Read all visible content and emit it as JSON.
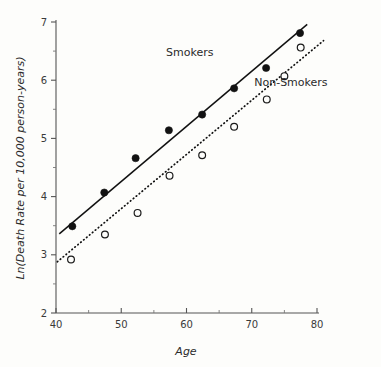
{
  "chart_data": {
    "type": "scatter",
    "title": "",
    "xlabel": "Age",
    "ylabel": "Ln(Death Rate per 10,000 person-years)",
    "xlim": [
      40,
      80
    ],
    "ylim": [
      2,
      7
    ],
    "xticks": [
      40,
      50,
      60,
      70,
      80
    ],
    "yticks": [
      2,
      3,
      4,
      5,
      6,
      7
    ],
    "x_minor_ticks": [
      45,
      55,
      65,
      75
    ],
    "y_minor_ticks": [
      2.5,
      3.5,
      4.5,
      5.5,
      6.5
    ],
    "xtick_labels": [
      "40",
      "50",
      "60",
      "70",
      "80"
    ],
    "ytick_labels": [
      "2",
      "3",
      "4",
      "5",
      "6",
      "7"
    ],
    "grid": false,
    "legend_position": "inline-annotation",
    "series": [
      {
        "name": "Smokers",
        "marker": "filled-circle",
        "fit_line_style": "solid",
        "points": [
          {
            "x": 42.5,
            "y": 3.49
          },
          {
            "x": 47.4,
            "y": 4.07
          },
          {
            "x": 52.2,
            "y": 4.66
          },
          {
            "x": 57.3,
            "y": 5.14
          },
          {
            "x": 62.4,
            "y": 5.41
          },
          {
            "x": 67.3,
            "y": 5.86
          },
          {
            "x": 72.2,
            "y": 6.21
          },
          {
            "x": 77.4,
            "y": 6.81
          }
        ],
        "fit_line": {
          "x1": 40.5,
          "y1": 3.36,
          "x2": 78.5,
          "y2": 6.96
        }
      },
      {
        "name": "Non-Smokers",
        "marker": "open-circle",
        "fit_line_style": "dotted",
        "points": [
          {
            "x": 42.3,
            "y": 2.92
          },
          {
            "x": 47.5,
            "y": 3.35
          },
          {
            "x": 52.5,
            "y": 3.72
          },
          {
            "x": 57.4,
            "y": 4.36
          },
          {
            "x": 62.4,
            "y": 4.71
          },
          {
            "x": 67.3,
            "y": 5.2
          },
          {
            "x": 72.3,
            "y": 5.67
          },
          {
            "x": 75.0,
            "y": 6.07
          },
          {
            "x": 77.5,
            "y": 6.56
          }
        ],
        "fit_line": {
          "x1": 40.2,
          "y1": 2.88,
          "x2": 81.0,
          "y2": 6.68
        }
      }
    ],
    "annotations": [
      {
        "text": "Smokers",
        "x": 60.5,
        "y": 6.42
      },
      {
        "text": "Non-Smokers",
        "x": 76.0,
        "y": 5.9
      }
    ]
  }
}
